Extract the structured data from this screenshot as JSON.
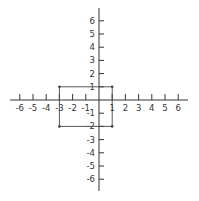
{
  "diagram": {
    "type": "coordinate-plane",
    "x_axis": {
      "min": -6,
      "max": 6,
      "ticks": [
        -6,
        -5,
        -4,
        -3,
        -2,
        -1,
        1,
        2,
        3,
        4,
        5,
        6
      ]
    },
    "y_axis": {
      "min": -6,
      "max": 6,
      "ticks": [
        6,
        5,
        4,
        3,
        2,
        1,
        -1,
        -2,
        -3,
        -4,
        -5,
        -6
      ]
    },
    "rectangle": {
      "vertices": [
        {
          "x": -3,
          "y": 1
        },
        {
          "x": 1,
          "y": 1
        },
        {
          "x": 1,
          "y": -2
        },
        {
          "x": -3,
          "y": -2
        }
      ]
    },
    "colors": {
      "axis": "#333333",
      "shape": "#444444",
      "label": "#333333"
    }
  },
  "layout": {
    "origin_x": 99,
    "origin_y": 100,
    "unit": 13.2
  }
}
